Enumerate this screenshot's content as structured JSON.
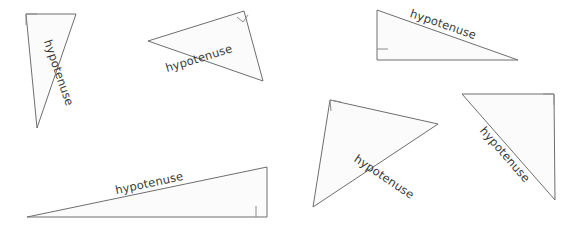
{
  "canvas": {
    "width": 578,
    "height": 234,
    "background": "#ffffff"
  },
  "style": {
    "triangle_fill": "#fbfbfb",
    "triangle_stroke": "#6e6e6e",
    "right_angle_stroke": "#8c8c8c",
    "label_color": "#3a3a3a",
    "label_font_size": 11.5
  },
  "figure": {
    "shape_count": 6,
    "label_text": "hypotenuse"
  },
  "triangles": [
    {
      "id": "triangle-1",
      "points": "26,14 76,14 37,128",
      "label": "hypotenuse",
      "label_x": 55,
      "label_y": 74,
      "label_rotation": 71,
      "right_angle_vertex": "26,14",
      "right_angle_mark": "26,25 26,14 37,14"
    },
    {
      "id": "triangle-2",
      "points": "148,41 244,11 263,81",
      "label": "hypotenuse",
      "label_x": 200,
      "label_y": 62,
      "label_rotation": -17,
      "right_angle_vertex": "244,11",
      "right_angle_mark": "237,17 243,22 248,15"
    },
    {
      "id": "triangle-3",
      "points": "377,10 377,60 518,60",
      "label": "hypotenuse",
      "label_x": 442,
      "label_y": 28,
      "label_rotation": 19,
      "right_angle_vertex": "377,60",
      "right_angle_mark": "377,49 388,49"
    },
    {
      "id": "triangle-4",
      "points": "27,217 267,167 267,217",
      "label": "hypotenuse",
      "label_x": 150,
      "label_y": 187,
      "label_rotation": -12,
      "right_angle_vertex": "267,217",
      "right_angle_mark": "256,217 256,206"
    },
    {
      "id": "triangle-5",
      "points": "330,100 438,124 313,207",
      "label": "hypotenuse",
      "label_x": 382,
      "label_y": 180,
      "label_rotation": 34,
      "right_angle_vertex": "330,100",
      "right_angle_mark": "331,111 330,100 341,102"
    },
    {
      "id": "triangle-6",
      "points": "462,94 554,94 555,200",
      "label": "hypotenuse",
      "label_x": 502,
      "label_y": 157,
      "label_rotation": 49,
      "right_angle_vertex": "554,94",
      "right_angle_mark": "543,94 554,94 554,105"
    }
  ]
}
